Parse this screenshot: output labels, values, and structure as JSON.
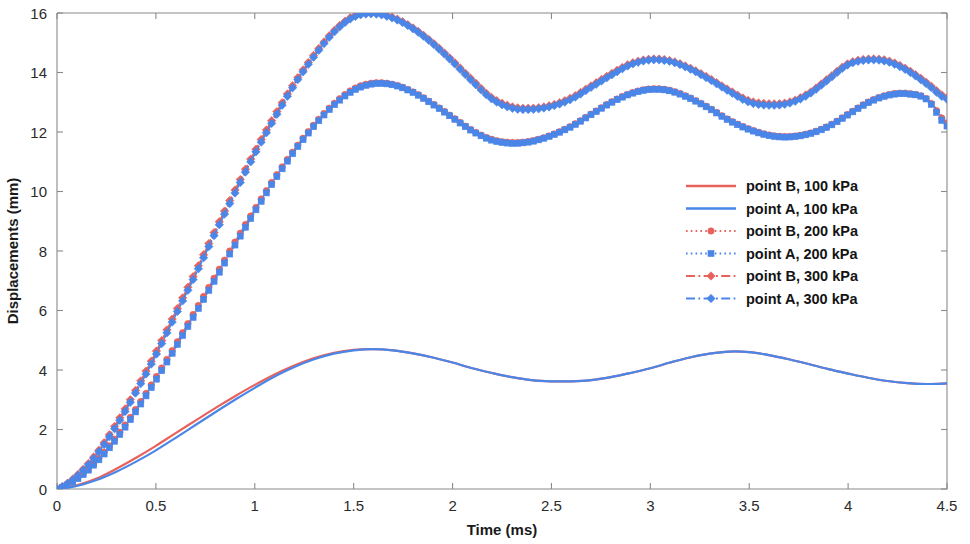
{
  "chart_data": {
    "type": "line",
    "title": "",
    "xlabel": "Time (ms)",
    "ylabel": "Displacements (mm)",
    "xlim": [
      0,
      4.5
    ],
    "ylim": [
      0,
      16
    ],
    "xticks": [
      0,
      0.5,
      1,
      1.5,
      2,
      2.5,
      3,
      3.5,
      4,
      4.5
    ],
    "xtick_labels": [
      "0",
      "0.5",
      "1",
      "1.5",
      "2",
      "2.5",
      "3",
      "3.5",
      "4",
      "4.5"
    ],
    "yticks": [
      0,
      2,
      4,
      6,
      8,
      10,
      12,
      14,
      16
    ],
    "ytick_labels": [
      "0",
      "2",
      "4",
      "6",
      "8",
      "10",
      "12",
      "14",
      "16"
    ],
    "grid": false,
    "legend_position": "center-right",
    "colors": {
      "red": "#e8625c",
      "blue": "#4a86e8",
      "axis": "#8a8a8a",
      "text": "#1a1a1a"
    },
    "x": [
      0,
      0.1,
      0.2,
      0.3,
      0.4,
      0.5,
      0.6,
      0.7,
      0.8,
      0.9,
      1.0,
      1.1,
      1.2,
      1.3,
      1.4,
      1.5,
      1.6,
      1.7,
      1.8,
      1.9,
      2.0,
      2.1,
      2.2,
      2.3,
      2.4,
      2.5,
      2.6,
      2.7,
      2.8,
      2.9,
      3.0,
      3.1,
      3.2,
      3.3,
      3.4,
      3.5,
      3.6,
      3.7,
      3.8,
      3.9,
      4.0,
      4.1,
      4.2,
      4.3,
      4.4,
      4.5
    ],
    "series": [
      {
        "name": "point B, 100 kPa",
        "label": "point B, 100 kPa",
        "color": "#e8625c",
        "style": "solid",
        "marker": "none",
        "values": [
          0,
          0.12,
          0.35,
          0.68,
          1.05,
          1.45,
          1.88,
          2.3,
          2.72,
          3.12,
          3.5,
          3.85,
          4.15,
          4.4,
          4.58,
          4.68,
          4.7,
          4.66,
          4.56,
          4.42,
          4.25,
          4.06,
          3.9,
          3.76,
          3.66,
          3.62,
          3.62,
          3.66,
          3.76,
          3.9,
          4.06,
          4.25,
          4.42,
          4.55,
          4.62,
          4.6,
          4.5,
          4.36,
          4.2,
          4.03,
          3.88,
          3.74,
          3.63,
          3.56,
          3.53,
          3.55
        ]
      },
      {
        "name": "point A, 100 kPa",
        "label": "point A, 100 kPa",
        "color": "#4a86e8",
        "style": "solid",
        "marker": "none",
        "values": [
          0,
          0.1,
          0.3,
          0.58,
          0.92,
          1.3,
          1.72,
          2.15,
          2.58,
          3.0,
          3.4,
          3.78,
          4.1,
          4.36,
          4.55,
          4.66,
          4.7,
          4.66,
          4.56,
          4.42,
          4.25,
          4.06,
          3.9,
          3.76,
          3.66,
          3.62,
          3.62,
          3.66,
          3.76,
          3.9,
          4.06,
          4.25,
          4.42,
          4.55,
          4.62,
          4.6,
          4.5,
          4.36,
          4.2,
          4.03,
          3.88,
          3.74,
          3.63,
          3.56,
          3.53,
          3.55
        ]
      },
      {
        "name": "point B, 200 kPa",
        "label": "point B, 200 kPa",
        "color": "#e8625c",
        "style": "dotted",
        "marker": "circle",
        "values": [
          0,
          0.35,
          0.95,
          1.75,
          2.7,
          3.75,
          4.85,
          6.0,
          7.15,
          8.3,
          9.4,
          10.45,
          11.4,
          12.25,
          12.95,
          13.45,
          13.65,
          13.6,
          13.35,
          12.95,
          12.5,
          12.05,
          11.75,
          11.65,
          11.7,
          11.9,
          12.2,
          12.6,
          13.0,
          13.3,
          13.45,
          13.4,
          13.15,
          12.8,
          12.4,
          12.1,
          11.9,
          11.85,
          11.95,
          12.2,
          12.6,
          13.0,
          13.25,
          13.3,
          13.1,
          12.3
        ]
      },
      {
        "name": "point A, 200 kPa",
        "label": "point A, 200 kPa",
        "color": "#4a86e8",
        "style": "dotted",
        "marker": "square",
        "values": [
          0,
          0.32,
          0.9,
          1.68,
          2.62,
          3.66,
          4.76,
          5.9,
          7.05,
          8.2,
          9.32,
          10.38,
          11.35,
          12.2,
          12.9,
          13.4,
          13.62,
          13.58,
          13.33,
          12.93,
          12.48,
          12.03,
          11.72,
          11.62,
          11.68,
          11.88,
          12.18,
          12.58,
          12.98,
          13.28,
          13.43,
          13.38,
          13.13,
          12.78,
          12.38,
          12.08,
          11.88,
          11.83,
          11.93,
          12.18,
          12.58,
          12.98,
          13.23,
          13.28,
          13.08,
          12.2
        ]
      },
      {
        "name": "point B, 300 kPa",
        "label": "point B, 300 kPa",
        "color": "#e8625c",
        "style": "dashdot",
        "marker": "diamond",
        "values": [
          0,
          0.45,
          1.2,
          2.2,
          3.35,
          4.6,
          5.95,
          7.3,
          8.7,
          10.05,
          11.35,
          12.55,
          13.65,
          14.6,
          15.4,
          15.9,
          16.0,
          15.85,
          15.5,
          15.0,
          14.4,
          13.75,
          13.15,
          12.85,
          12.8,
          12.9,
          13.15,
          13.55,
          13.95,
          14.3,
          14.45,
          14.4,
          14.15,
          13.8,
          13.4,
          13.05,
          12.95,
          13.0,
          13.3,
          13.8,
          14.3,
          14.45,
          14.4,
          14.1,
          13.65,
          13.15
        ]
      },
      {
        "name": "point A, 300 kPa",
        "label": "point A, 300 kPa",
        "color": "#4a86e8",
        "style": "dashdot",
        "marker": "diamond",
        "values": [
          0,
          0.42,
          1.15,
          2.12,
          3.26,
          4.5,
          5.85,
          7.2,
          8.6,
          9.95,
          11.26,
          12.46,
          13.58,
          14.54,
          15.35,
          15.86,
          15.97,
          15.82,
          15.47,
          14.97,
          14.36,
          13.7,
          13.1,
          12.8,
          12.76,
          12.86,
          13.1,
          13.5,
          13.9,
          14.26,
          14.42,
          14.37,
          14.12,
          13.76,
          13.36,
          13.0,
          12.9,
          12.96,
          13.26,
          13.76,
          14.26,
          14.42,
          14.36,
          14.06,
          13.6,
          13.1
        ]
      }
    ]
  },
  "legend": {
    "entries": [
      {
        "label": "point B, 100 kPa"
      },
      {
        "label": "point A, 100 kPa"
      },
      {
        "label": "point B, 200 kPa"
      },
      {
        "label": "point A, 200 kPa"
      },
      {
        "label": "point B, 300 kPa"
      },
      {
        "label": "point A, 300 kPa"
      }
    ]
  }
}
